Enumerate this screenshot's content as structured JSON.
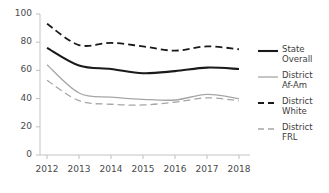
{
  "chart_data": {
    "type": "line",
    "title": "",
    "xlabel": "",
    "ylabel": "",
    "categories": [
      "2012",
      "2013",
      "2014",
      "2015",
      "2016",
      "2017",
      "2018"
    ],
    "x": [
      2012,
      2013,
      2014,
      2015,
      2016,
      2017,
      2018
    ],
    "ylim": [
      0,
      100
    ],
    "yticks": [
      0,
      20,
      40,
      60,
      80,
      100
    ],
    "ytick_labels": [
      "0",
      "20",
      "40",
      "60",
      "80",
      "100"
    ],
    "grid": false,
    "legend_position": "right",
    "series": [
      {
        "name": "State Overall",
        "legend_label": "State\nOverall",
        "values": [
          76,
          63.5,
          61,
          58,
          59.5,
          62,
          61
        ],
        "color": "#1a1a1a",
        "style": "solid",
        "width": 2.1
      },
      {
        "name": "District Af-Am",
        "legend_label": "District\nAf-Am",
        "values": [
          64,
          44,
          41,
          39.5,
          39,
          43,
          40
        ],
        "color": "#a6a6a6",
        "style": "solid",
        "width": 1.3
      },
      {
        "name": "District White",
        "legend_label": "District\nWhite",
        "values": [
          93,
          78,
          79.5,
          77,
          74,
          77,
          75
        ],
        "color": "#1a1a1a",
        "style": "dashed",
        "width": 1.8
      },
      {
        "name": "District FRL",
        "legend_label": "District\nFRL",
        "values": [
          53,
          38.5,
          36,
          35.5,
          37.5,
          40.5,
          38.5
        ],
        "color": "#a6a6a6",
        "style": "dashed",
        "width": 1.3
      }
    ]
  },
  "axis": {
    "line_color": "#bfbfbf",
    "tick_color": "#bfbfbf"
  }
}
